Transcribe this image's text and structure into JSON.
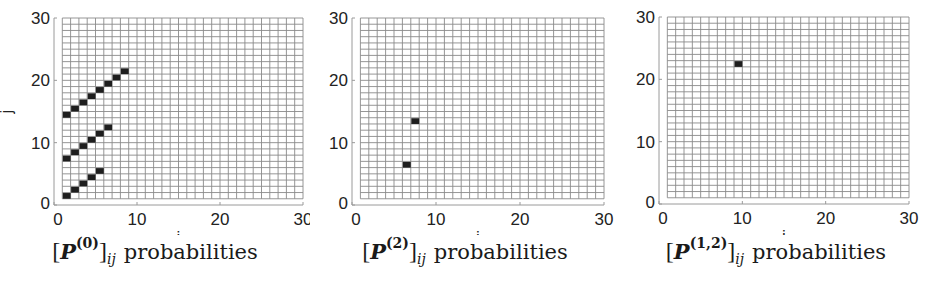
{
  "chart_data": [
    {
      "type": "heatmap",
      "title": "[P^(0)]_ij probabilities",
      "caption": {
        "matrix": "P",
        "superscript": "(0)",
        "subscript": "ij",
        "word": "probabilities"
      },
      "xlabel": "i",
      "ylabel": "j",
      "xlim": [
        0,
        30
      ],
      "ylim": [
        0,
        30
      ],
      "xticks": [
        0,
        10,
        20,
        30
      ],
      "yticks": [
        0,
        10,
        20,
        30
      ],
      "grid": {
        "from": 1,
        "to": 30
      },
      "filled_cells": [
        [
          1,
          1
        ],
        [
          2,
          2
        ],
        [
          3,
          3
        ],
        [
          4,
          4
        ],
        [
          5,
          5
        ],
        [
          1,
          7
        ],
        [
          2,
          8
        ],
        [
          3,
          9
        ],
        [
          4,
          10
        ],
        [
          5,
          11
        ],
        [
          6,
          12
        ],
        [
          1,
          14
        ],
        [
          2,
          15
        ],
        [
          3,
          16
        ],
        [
          4,
          17
        ],
        [
          5,
          18
        ],
        [
          6,
          19
        ],
        [
          7,
          20
        ],
        [
          8,
          21
        ]
      ]
    },
    {
      "type": "heatmap",
      "title": "[P^(2)]_ij probabilities",
      "caption": {
        "matrix": "P",
        "superscript": "(2)",
        "subscript": "ij",
        "word": "probabilities"
      },
      "xlabel": "i",
      "ylabel": "",
      "xlim": [
        0,
        30
      ],
      "ylim": [
        0,
        30
      ],
      "xticks": [
        0,
        10,
        20,
        30
      ],
      "yticks": [
        0,
        10,
        20,
        30
      ],
      "grid": {
        "from": 1,
        "to": 30
      },
      "filled_cells": [
        [
          6,
          6
        ],
        [
          7,
          13
        ]
      ]
    },
    {
      "type": "heatmap",
      "title": "[P^(1,2)]_ij probabilities",
      "caption": {
        "matrix": "P",
        "superscript": "(1,2)",
        "subscript": "ij",
        "word": "probabilities"
      },
      "xlabel": "i",
      "ylabel": "",
      "xlim": [
        0,
        30
      ],
      "ylim": [
        0,
        30
      ],
      "xticks": [
        0,
        10,
        20,
        30
      ],
      "yticks": [
        0,
        10,
        20,
        30
      ],
      "grid": {
        "from": 1,
        "to": 30
      },
      "filled_cells": [
        [
          9,
          22
        ]
      ]
    }
  ],
  "panels": [
    {
      "caption": {
        "open": "[",
        "matrix": "P",
        "sup": "(0)",
        "close": "]",
        "sub": "ij",
        "word": "probabilities"
      },
      "xlabel": "i",
      "ylabel": "j"
    },
    {
      "caption": {
        "open": "[",
        "matrix": "P",
        "sup": "(2)",
        "close": "]",
        "sub": "ij",
        "word": "probabilities"
      },
      "xlabel": "i",
      "ylabel": ""
    },
    {
      "caption": {
        "open": "[",
        "matrix": "P",
        "sup": "(1,2)",
        "close": "]",
        "sub": "ij",
        "word": "probabilities"
      },
      "xlabel": "i",
      "ylabel": ""
    }
  ],
  "colors": {
    "grid": "#8a8a8a",
    "cell": "#1e1e1e",
    "axis": "#9a9a9a",
    "text": "#222222"
  }
}
